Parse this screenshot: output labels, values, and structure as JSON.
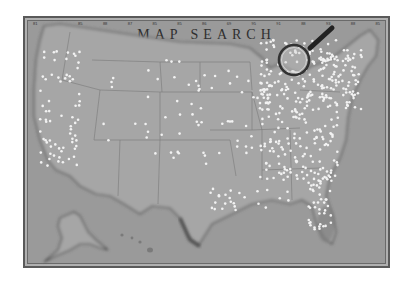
{
  "title": "MAP SEARCH",
  "ticks": [
    "81",
    "",
    "85",
    "88",
    "87",
    "85",
    "85",
    "86",
    "69",
    "95",
    "91",
    "88",
    "93",
    "88",
    "85"
  ],
  "colors": {
    "background": "#ffffff",
    "map_paper": "#9a9a9a",
    "land": "#a4a4a4",
    "border": "#4a4a4a",
    "pin": "#f2f2f2",
    "title": "#2f2f2f"
  },
  "icons": {
    "magnifier": "magnifying-glass-icon",
    "pin": "map-pin"
  },
  "regions": [
    "Contiguous United States",
    "Alaska",
    "Hawaii"
  ]
}
